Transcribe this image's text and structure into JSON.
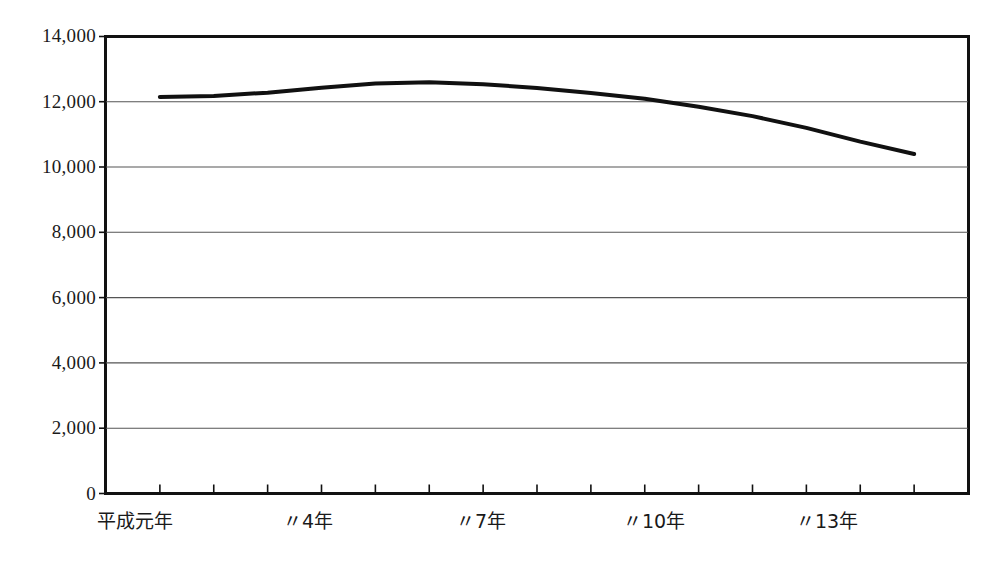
{
  "chart": {
    "title": ""
  },
  "chart_data": {
    "type": "line",
    "title": "",
    "subtitle": "",
    "xlabel": "",
    "ylabel": "",
    "grid": true,
    "legend": "none",
    "ylim": [
      0,
      14000
    ],
    "yticks": [
      0,
      2000,
      4000,
      6000,
      8000,
      10000,
      12000,
      14000
    ],
    "ytick_labels": [
      "0",
      "2,000",
      "4,000",
      "6,000",
      "8,000",
      "10,000",
      "12,000",
      "14,000"
    ],
    "x": [
      "平成元年",
      "〃2年",
      "〃3年",
      "〃4年",
      "〃5年",
      "〃6年",
      "〃7年",
      "〃8年",
      "〃9年",
      "〃10年",
      "〃11年",
      "〃12年",
      "〃13年",
      "〃14年",
      "〃15年"
    ],
    "xtick_labels": [
      "平成元年",
      "〃4年",
      "〃7年",
      "〃10年",
      "〃13年"
    ],
    "xtick_label_indices": [
      0,
      3,
      6,
      9,
      12
    ],
    "series": [
      {
        "name": "",
        "color": "#111111",
        "values": [
          12150,
          12180,
          12280,
          12430,
          12560,
          12600,
          12540,
          12420,
          12270,
          12090,
          11850,
          11560,
          11200,
          10780,
          10400
        ]
      }
    ],
    "annotations": []
  },
  "axis": {
    "y_labels": [
      "14,000",
      "12,000",
      "10,000",
      "8,000",
      "6,000",
      "4,000",
      "2,000",
      "0"
    ],
    "x_labels": [
      "平成元年",
      "〃4年",
      "〃7年",
      "〃10年",
      "〃13年"
    ]
  }
}
